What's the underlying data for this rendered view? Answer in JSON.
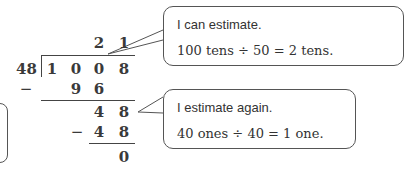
{
  "division": {
    "divisor": "48",
    "dividend": [
      "1",
      "0",
      "0",
      "8"
    ],
    "quotient": [
      "2",
      "1"
    ],
    "step1_minus": "−",
    "step1_subtract": [
      "9",
      "6"
    ],
    "step1_remainder": [
      "4",
      "8"
    ],
    "step2_minus": "−",
    "step2_subtract": [
      "4",
      "8"
    ],
    "final_remainder": "0"
  },
  "bubbles": [
    {
      "line1": "I can estimate.",
      "line2": "100 tens ÷ 50 = 2 tens."
    },
    {
      "line1": "I estimate again.",
      "line2": "40 ones ÷ 40 = 1 one."
    }
  ]
}
